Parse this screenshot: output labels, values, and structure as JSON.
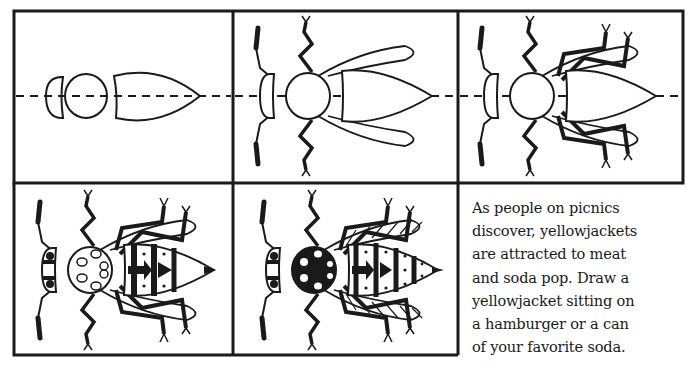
{
  "page": {
    "panels": [
      {
        "step": 1,
        "description": "basic head, thorax and abdomen shapes on dashed center line"
      },
      {
        "step": 2,
        "description": "add antennae, front legs and wings"
      },
      {
        "step": 3,
        "description": "add middle and hind legs"
      },
      {
        "step": 4,
        "description": "add eyes, thorax pattern and abdomen stripes"
      },
      {
        "step": 5,
        "description": "finished yellowjacket with hatched wings and dotted stripes"
      }
    ],
    "caption": {
      "lines": [
        "As people on picnics",
        "discover, yellowjackets",
        "are attracted to meat",
        "and soda pop. Draw a",
        "yellowjacket sitting on",
        "a hamburger or a can",
        "of your favorite soda."
      ]
    },
    "colors": {
      "ink": "#1a1a1a",
      "paper": "#ffffff"
    }
  }
}
